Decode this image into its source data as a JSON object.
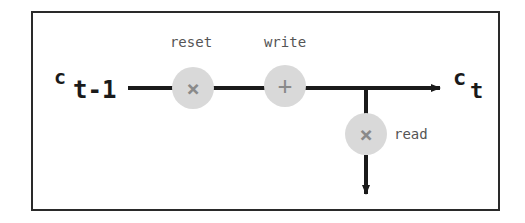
{
  "diagram": {
    "title": "",
    "input_state": {
      "base": "c",
      "subscript": "t-1"
    },
    "output_state": {
      "base": "c",
      "subscript": "t"
    },
    "gates": [
      {
        "id": "reset",
        "label": "reset",
        "operator": "×",
        "icon": "multiply-icon"
      },
      {
        "id": "write",
        "label": "write",
        "operator": "+",
        "icon": "plus-icon"
      },
      {
        "id": "read",
        "label": "read",
        "operator": "×",
        "icon": "multiply-icon"
      }
    ],
    "edges": [
      {
        "from": "c_t-1",
        "to": "reset"
      },
      {
        "from": "reset",
        "to": "write"
      },
      {
        "from": "write",
        "to": "c_t",
        "arrow": true
      },
      {
        "from": "main-line",
        "to": "read"
      },
      {
        "from": "read",
        "to": "output-down",
        "arrow": true
      }
    ],
    "colors": {
      "line": "#1a1a1a",
      "gate_fill": "#d9d9d9",
      "gate_symbol": "#8a8a8a",
      "label": "#555555",
      "border": "#2a2a2a"
    }
  }
}
